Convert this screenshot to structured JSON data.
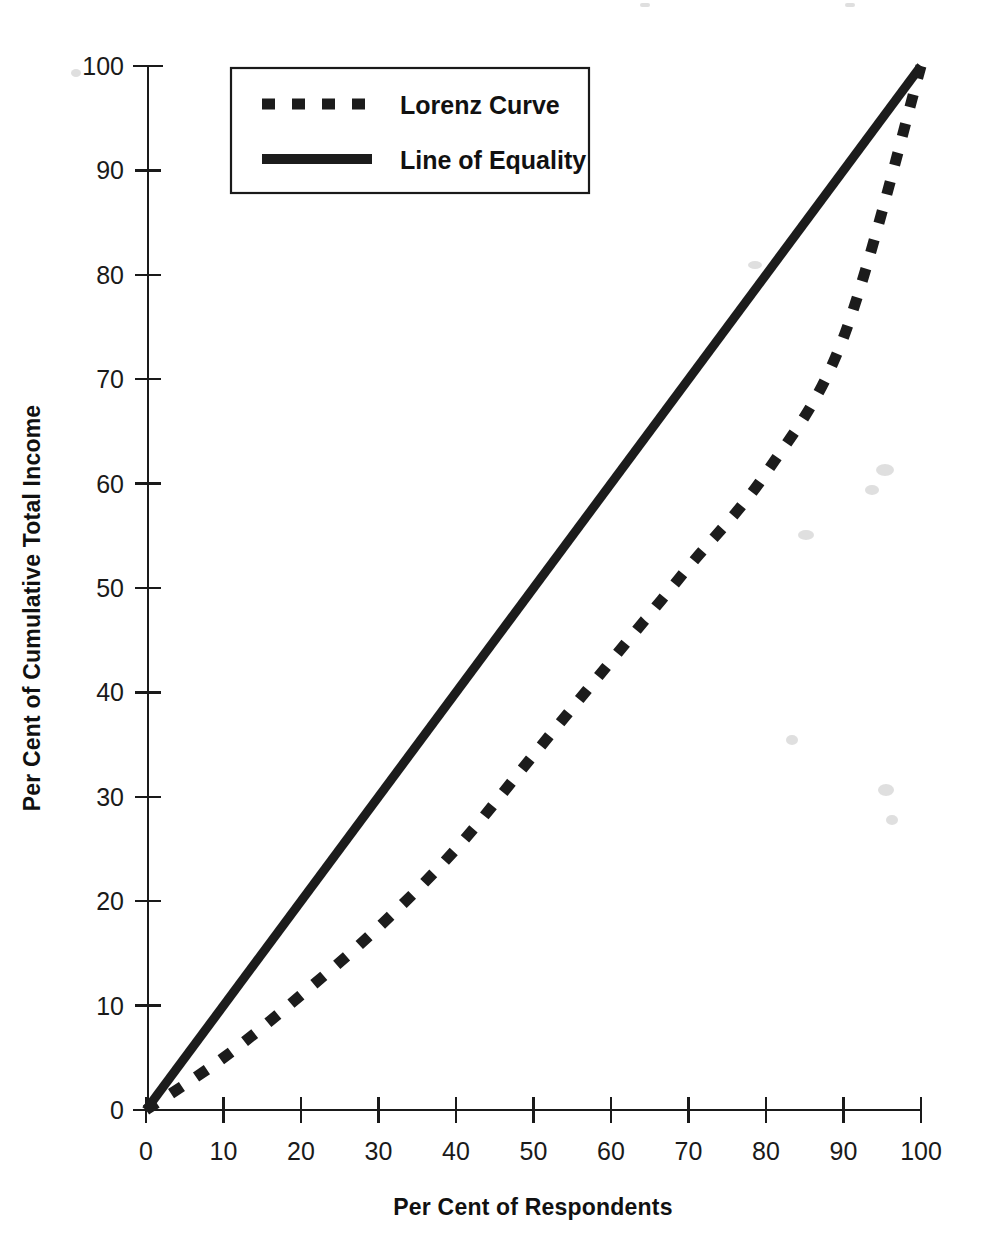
{
  "chart_data": {
    "type": "line",
    "title": "",
    "xlabel": "Per Cent of Respondents",
    "ylabel": "Per Cent of Cumulative Total Income",
    "xlim": [
      0,
      100
    ],
    "ylim": [
      0,
      100
    ],
    "grid": false,
    "legend_position": "top-left-inside",
    "x_ticks": [
      "0",
      "10",
      "20",
      "30",
      "40",
      "50",
      "60",
      "70",
      "80",
      "90",
      "100"
    ],
    "y_ticks": [
      "0",
      "10",
      "20",
      "30",
      "40",
      "50",
      "60",
      "70",
      "80",
      "90",
      "100"
    ],
    "x_tick_values": [
      0,
      10,
      20,
      30,
      40,
      50,
      60,
      70,
      80,
      90,
      100
    ],
    "y_tick_values": [
      0,
      10,
      20,
      30,
      40,
      50,
      60,
      70,
      80,
      90,
      100
    ],
    "series": [
      {
        "name": "Lorenz Curve",
        "style": "dashed",
        "color": "#1c1c1c",
        "x": [
          0,
          10,
          20,
          30,
          40,
          50,
          60,
          70,
          80,
          90,
          100
        ],
        "values": [
          0,
          5,
          11,
          17.5,
          25,
          34,
          43,
          52,
          61,
          74,
          100
        ]
      },
      {
        "name": "Line of Equality",
        "style": "solid",
        "color": "#1c1c1c",
        "x": [
          0,
          100
        ],
        "values": [
          0,
          100
        ]
      }
    ]
  },
  "legend": {
    "items": [
      {
        "label": "Lorenz Curve",
        "style": "dashed"
      },
      {
        "label": "Line of Equality",
        "style": "solid"
      }
    ]
  },
  "axes": {
    "x_title": "Per Cent of Respondents",
    "y_title": "Per Cent of Cumulative Total Income",
    "x_labels": [
      "0",
      "10",
      "20",
      "30",
      "40",
      "50",
      "60",
      "70",
      "80",
      "90",
      "100"
    ],
    "y_labels": [
      "0",
      "10",
      "20",
      "30",
      "40",
      "50",
      "60",
      "70",
      "80",
      "90",
      "100"
    ]
  },
  "colors": {
    "ink": "#1c1c1c",
    "background": "#ffffff"
  }
}
